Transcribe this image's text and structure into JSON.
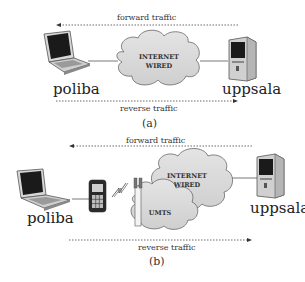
{
  "diagram_a": {
    "forward_label": "forward traffic",
    "reverse_label": "reverse traffic",
    "cloud_label_line1": "INTERNET",
    "cloud_label_line2": "WIRED",
    "left_host": "poliba",
    "right_host": "uppsala",
    "caption": "(a)"
  },
  "diagram_b": {
    "forward_label": "forward traffic",
    "reverse_label": "reverse traffic",
    "cloud_label_line1": "INTERNET",
    "cloud_label_line2": "WIRED",
    "umts_label": "UMTS",
    "left_host": "poliba",
    "right_host": "uppsala",
    "caption": "(b)"
  },
  "icons": [
    "laptop-icon",
    "desktop-tower-icon",
    "cloud-icon",
    "mobile-phone-icon",
    "wireless-signal-icon",
    "antenna-tower-icon"
  ]
}
